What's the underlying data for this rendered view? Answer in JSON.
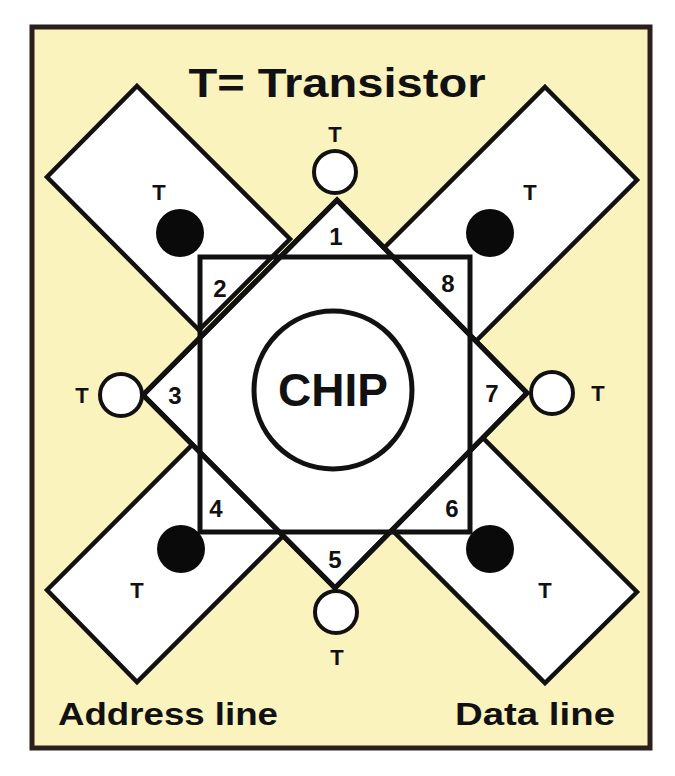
{
  "diagram": {
    "title": "T= Transistor",
    "legend": {
      "symbol": "T",
      "meaning": "Transistor"
    },
    "center_label": "CHIP",
    "bottom_labels": {
      "left": "Address line",
      "right": "Data line"
    },
    "regions": [
      {
        "id": 1,
        "label": "1",
        "position": "top"
      },
      {
        "id": 2,
        "label": "2",
        "position": "top-left"
      },
      {
        "id": 3,
        "label": "3",
        "position": "left"
      },
      {
        "id": 4,
        "label": "4",
        "position": "bottom-left"
      },
      {
        "id": 5,
        "label": "5",
        "position": "bottom"
      },
      {
        "id": 6,
        "label": "6",
        "position": "bottom-right"
      },
      {
        "id": 7,
        "label": "7",
        "position": "right"
      },
      {
        "id": 8,
        "label": "8",
        "position": "top-right"
      }
    ],
    "transistors": [
      {
        "label": "T",
        "position": "top",
        "fill": "white"
      },
      {
        "label": "T",
        "position": "top-left",
        "fill": "black"
      },
      {
        "label": "T",
        "position": "top-right",
        "fill": "black"
      },
      {
        "label": "T",
        "position": "left",
        "fill": "white"
      },
      {
        "label": "T",
        "position": "right",
        "fill": "white"
      },
      {
        "label": "T",
        "position": "bottom-left",
        "fill": "black"
      },
      {
        "label": "T",
        "position": "bottom-right",
        "fill": "black"
      },
      {
        "label": "T",
        "position": "bottom",
        "fill": "white"
      }
    ],
    "colors": {
      "background": "#FBF3BE",
      "frame": "#2a1f1a",
      "stroke": "#111111",
      "shape_fill": "#ffffff",
      "filled_transistor": "#0a0a0a"
    }
  }
}
